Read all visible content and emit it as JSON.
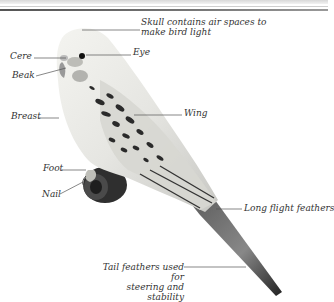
{
  "header": {
    "title_visible": false
  },
  "diagram": {
    "labels": [
      {
        "id": "skull",
        "lines": [
          "Skull contains air spaces to",
          "make bird light"
        ]
      },
      {
        "id": "cere",
        "lines": [
          "Cere"
        ]
      },
      {
        "id": "eye",
        "lines": [
          "Eye"
        ]
      },
      {
        "id": "beak",
        "lines": [
          "Beak"
        ]
      },
      {
        "id": "breast",
        "lines": [
          "Breast"
        ]
      },
      {
        "id": "wing",
        "lines": [
          "Wing"
        ]
      },
      {
        "id": "foot",
        "lines": [
          "Foot"
        ]
      },
      {
        "id": "nail",
        "lines": [
          "Nail"
        ]
      },
      {
        "id": "long-flight-feathers",
        "lines": [
          "Long flight feathers"
        ]
      },
      {
        "id": "tail-feathers",
        "lines": [
          "Tail feathers used for",
          "steering and stability"
        ]
      }
    ],
    "colors": {
      "background": "#ffffff",
      "label_text": "#333333",
      "leader_line": "#555555",
      "bird_light": "#eeeeea",
      "bird_mark": "#2a2a2a"
    }
  }
}
